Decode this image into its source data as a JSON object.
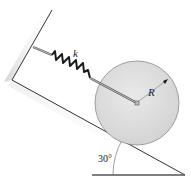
{
  "figure": {
    "labels": {
      "spring_constant": "k",
      "radius": "R",
      "angle": "30°"
    },
    "colors": {
      "line": "#333333",
      "disk_fill": "#dcdcdc",
      "disk_edge": "#8a8a8a",
      "spring": "#1a1a1a",
      "rod": "#555555",
      "wall_shadow": "#e6e6e6"
    }
  }
}
